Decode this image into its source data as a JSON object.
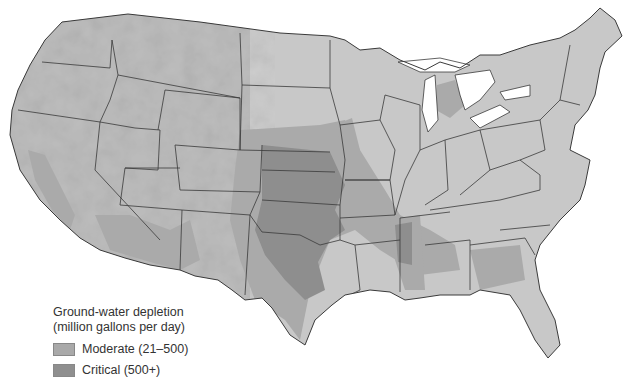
{
  "map": {
    "subject": "Contiguous United States ground-water depletion",
    "base_color": "#c4c4c4",
    "water_color": "#ffffff",
    "border_color": "#3a3a3a"
  },
  "legend": {
    "title_line1": "Ground-water depletion",
    "title_line2": "(million gallons per day)",
    "items": [
      {
        "label": "Moderate (21–500)",
        "color": "#a9a9a9"
      },
      {
        "label": "Critical (500+)",
        "color": "#8f8f8f"
      }
    ]
  }
}
